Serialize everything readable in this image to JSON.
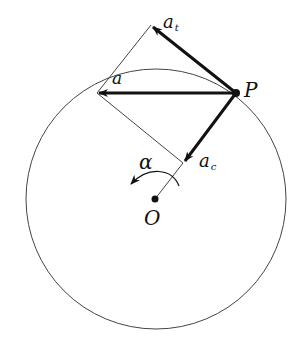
{
  "diagram": {
    "type": "circular-motion-acceleration",
    "labels": {
      "total_acceleration": "a",
      "tangential": {
        "base": "a",
        "sub": "t"
      },
      "centripetal": {
        "base": "a",
        "sub": "c"
      },
      "point": "P",
      "center": "O",
      "angular_acceleration": "α"
    },
    "geometry": {
      "circle": {
        "cx": 156,
        "cy": 199,
        "r": 130
      },
      "P": [
        236,
        93
      ],
      "O": [
        155,
        199
      ],
      "a_tip": [
        97,
        93
      ],
      "at_tip": [
        151,
        25
      ],
      "ac_tip": [
        183,
        163
      ]
    },
    "colors": {
      "stroke": "#111111",
      "thin": "#444444"
    }
  }
}
